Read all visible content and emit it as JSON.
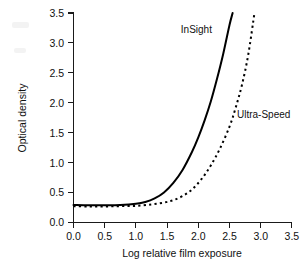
{
  "chart_data": {
    "type": "line",
    "title": "",
    "xlabel": "Log relative film exposure",
    "ylabel": "Optical density",
    "xlim": [
      0.0,
      3.5
    ],
    "ylim": [
      0.0,
      3.5
    ],
    "xticks": [
      "0.0",
      "0.5",
      "1.0",
      "1.5",
      "2.0",
      "2.5",
      "3.0",
      "3.5"
    ],
    "yticks": [
      "0.0",
      "0.5",
      "1.0",
      "1.5",
      "2.0",
      "2.5",
      "3.0",
      "3.5"
    ],
    "grid": false,
    "legend_position": "inline-annotation",
    "series": [
      {
        "name": "InSight",
        "style": "solid",
        "color": "#000000",
        "x": [
          0.0,
          0.25,
          0.5,
          0.75,
          1.0,
          1.15,
          1.3,
          1.45,
          1.6,
          1.75,
          1.9,
          2.0,
          2.1,
          2.2,
          2.3,
          2.4,
          2.5,
          2.55
        ],
        "y": [
          0.29,
          0.285,
          0.285,
          0.29,
          0.31,
          0.34,
          0.4,
          0.5,
          0.66,
          0.88,
          1.18,
          1.42,
          1.7,
          2.02,
          2.4,
          2.82,
          3.3,
          3.5
        ]
      },
      {
        "name": "Ultra-Speed",
        "style": "dashed",
        "color": "#000000",
        "x": [
          0.0,
          0.25,
          0.5,
          0.75,
          1.0,
          1.25,
          1.45,
          1.6,
          1.75,
          1.9,
          2.05,
          2.2,
          2.35,
          2.5,
          2.6,
          2.7,
          2.8,
          2.9
        ],
        "y": [
          0.27,
          0.265,
          0.265,
          0.27,
          0.275,
          0.3,
          0.33,
          0.37,
          0.44,
          0.55,
          0.72,
          0.95,
          1.24,
          1.6,
          1.92,
          2.3,
          2.8,
          3.5
        ]
      }
    ],
    "annotations": [
      {
        "text": "InSight",
        "x": 1.72,
        "y": 3.16
      },
      {
        "text": "Ultra-Speed",
        "x": 2.62,
        "y": 1.74
      }
    ]
  },
  "axis": {
    "x_title": "Log relative film exposure",
    "y_title": "Optical density"
  }
}
